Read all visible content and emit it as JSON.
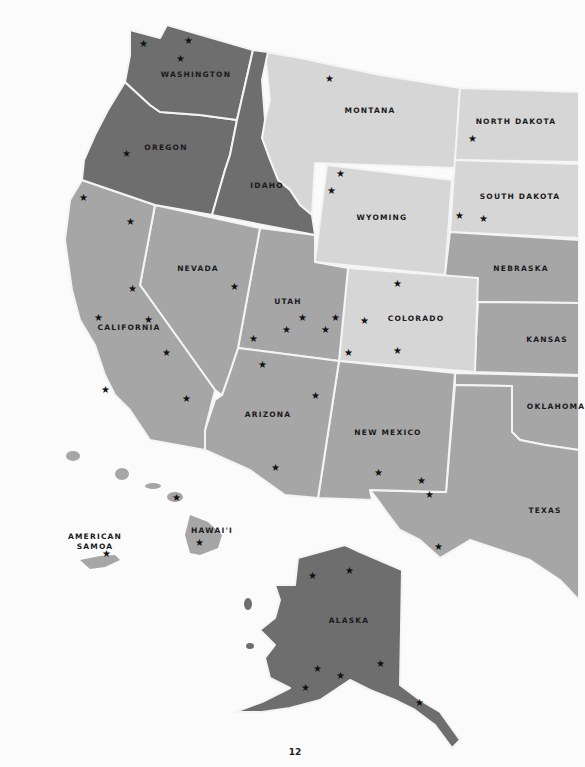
{
  "page": {
    "number": "12"
  },
  "colors": {
    "dark": "#6e6e6e",
    "medium": "#a6a6a6",
    "light": "#d6d6d6",
    "border": "#f4f4f4",
    "background": "#fbfbfb",
    "star": "#111111"
  },
  "states": [
    {
      "name": "WASHINGTON",
      "shade": "dark"
    },
    {
      "name": "OREGON",
      "shade": "dark"
    },
    {
      "name": "IDAHO",
      "shade": "dark"
    },
    {
      "name": "MONTANA",
      "shade": "light"
    },
    {
      "name": "NORTH DAKOTA",
      "shade": "light"
    },
    {
      "name": "SOUTH DAKOTA",
      "shade": "light"
    },
    {
      "name": "WYOMING",
      "shade": "light"
    },
    {
      "name": "COLORADO",
      "shade": "light"
    },
    {
      "name": "NEBRASKA",
      "shade": "medium"
    },
    {
      "name": "KANSAS",
      "shade": "medium"
    },
    {
      "name": "OKLAHOMA",
      "shade": "medium"
    },
    {
      "name": "TEXAS",
      "shade": "medium"
    },
    {
      "name": "NEW MEXICO",
      "shade": "medium"
    },
    {
      "name": "ARIZONA",
      "shade": "medium"
    },
    {
      "name": "UTAH",
      "shade": "medium"
    },
    {
      "name": "NEVADA",
      "shade": "medium"
    },
    {
      "name": "CALIFORNIA",
      "shade": "medium"
    },
    {
      "name": "HAWAI'I",
      "shade": "medium"
    },
    {
      "name": "AMERICAN SAMOA",
      "shade": "medium"
    },
    {
      "name": "ALASKA",
      "shade": "dark"
    }
  ],
  "labels": {
    "washington": "WASHINGTON",
    "oregon": "OREGON",
    "idaho": "IDAHO",
    "montana": "MONTANA",
    "north_dakota": "NORTH DAKOTA",
    "south_dakota": "SOUTH DAKOTA",
    "wyoming": "WYOMING",
    "nebraska": "NEBRASKA",
    "nevada": "NEVADA",
    "utah": "UTAH",
    "colorado": "COLORADO",
    "kansas": "KANSAS",
    "california": "CALIFORNIA",
    "arizona": "ARIZONA",
    "new_mexico": "NEW MEXICO",
    "oklahoma": "OKLAHOMA",
    "texas": "TEXAS",
    "hawaii": "HAWAI'I",
    "american_samoa_1": "AMERICAN",
    "american_samoa_2": "SAMOA",
    "alaska": "ALASKA"
  },
  "star_glyph": "★",
  "star_count": 47
}
